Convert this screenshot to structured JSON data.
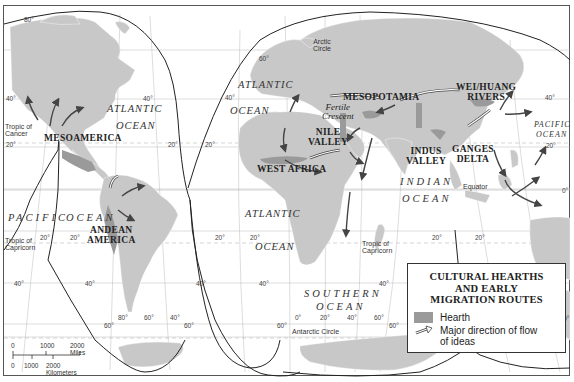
{
  "map": {
    "title": "Cultural Hearths and Early Migration Routes",
    "hearths": [
      {
        "name": "MESOAMERICA"
      },
      {
        "name": "ANDEAN AMERICA"
      },
      {
        "name": "MESOPOTAMIA"
      },
      {
        "name": "NILE VALLEY"
      },
      {
        "name": "WEST AFRICA"
      },
      {
        "name": "INDUS VALLEY"
      },
      {
        "name": "GANGES DELTA"
      },
      {
        "name": "WEI/HUANG RIVERS"
      }
    ],
    "regions": {
      "mesoamerica": "MESOAMERICA",
      "andean_1": "ANDEAN",
      "andean_2": "AMERICA",
      "mesopotamia": "MESOPOTAMIA",
      "nile_1": "NILE",
      "nile_2": "VALLEY",
      "west_africa": "WEST AFRICA",
      "indus_1": "INDUS",
      "indus_2": "VALLEY",
      "ganges_1": "GANGES",
      "ganges_2": "DELTA",
      "wei_1": "WEI/HUANG",
      "wei_2": "RIVERS",
      "fertile_1": "Fertile",
      "fertile_2": "Crescent"
    },
    "oceans": {
      "atlantic_w1": "ATLANTIC",
      "atlantic_w2": "OCEAN",
      "atlantic_n1": "ATLANTIC",
      "atlantic_n2": "OCEAN",
      "atlantic_s1": "ATLANTIC",
      "atlantic_s2": "OCEAN",
      "pacific_w1": "PACIFIC",
      "pacific_w2": "OCEAN",
      "pacific_e1": "PACIFIC",
      "pacific_e2": "OCEAN",
      "indian_1": "INDIAN",
      "indian_2": "OCEAN",
      "southern_1": "SOUTHERN",
      "southern_2": "OCEAN"
    },
    "lines": {
      "arctic_1": "Arctic",
      "arctic_2": "Circle",
      "cancer_1": "Tropic of",
      "cancer_2": "Cancer",
      "capricorn_w1": "Tropic of",
      "capricorn_w2": "Capricorn",
      "capricorn_e1": "Tropic of",
      "capricorn_e2": "Capricorn",
      "equator": "Equator",
      "antarctic": "Antarctic Circle"
    },
    "degrees": {
      "d80n": "80°",
      "d60": "60°",
      "d40": "40°",
      "d20": "20°",
      "d0": "0°",
      "d80": "80°",
      "d120": "120°"
    }
  },
  "legend": {
    "title_1": "CULTURAL HEARTHS",
    "title_2": "AND EARLY",
    "title_3": "MIGRATION ROUTES",
    "hearth_label": "Hearth",
    "flow_label_1": "Major direction of flow",
    "flow_label_2": "of ideas",
    "colors": {
      "hearth": "#9a9a9a",
      "land": "#c8c8c8",
      "arrow": "#4a4a4a"
    }
  },
  "scale": {
    "miles_0": "0",
    "miles_1000": "1000",
    "miles_2000": "2000 Miles",
    "km_0": "0",
    "km_1000": "1000",
    "km_2000": "2000 Kilometers"
  }
}
